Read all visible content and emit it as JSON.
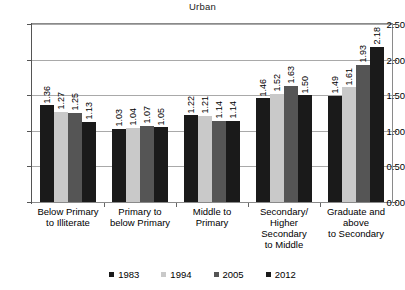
{
  "chart_data": {
    "type": "bar",
    "title": "Urban",
    "xlabel": "",
    "ylabel": "",
    "ylim": [
      0,
      2.5
    ],
    "ytick_labels": [
      "0.00",
      "0.50",
      "1.00",
      "1.50",
      "2.00",
      "2.50"
    ],
    "ytick_values": [
      0,
      0.5,
      1.0,
      1.5,
      2.0,
      2.5
    ],
    "grid": true,
    "legend_position": "bottom",
    "categories": [
      "Below Primary to Illiterate",
      "Primary to below Primary",
      "Middle to Primary",
      "Secondary/ Higher Secondary to Middle",
      "Graduate and above to Secondary"
    ],
    "category_lines": [
      [
        "Below Primary",
        "to Illiterate"
      ],
      [
        "Primary to",
        "below Primary"
      ],
      [
        "Middle to",
        "Primary"
      ],
      [
        "Secondary/",
        "Higher",
        "Secondary",
        "to Middle"
      ],
      [
        "Graduate and",
        "above",
        "to Secondary"
      ]
    ],
    "series": [
      {
        "name": "1983",
        "color": "#1a1a1a",
        "values": [
          1.36,
          1.03,
          1.22,
          1.46,
          1.49
        ],
        "labels": [
          "1.36",
          "1.03",
          "1.22",
          "1.46",
          "1.49"
        ]
      },
      {
        "name": "1994",
        "color": "#c9c9c9",
        "values": [
          1.27,
          1.04,
          1.21,
          1.52,
          1.61
        ],
        "labels": [
          "1.27",
          "1.04",
          "1.21",
          "1.52",
          "1.61"
        ]
      },
      {
        "name": "2005",
        "color": "#555555",
        "values": [
          1.25,
          1.07,
          1.14,
          1.63,
          1.93
        ],
        "labels": [
          "1.25",
          "1.07",
          "1.14",
          "1.63",
          "1.93"
        ]
      },
      {
        "name": "2012",
        "color": "#1a1a1a",
        "values": [
          1.13,
          1.05,
          1.14,
          1.5,
          2.18
        ],
        "labels": [
          "1.13",
          "1.05",
          "1.14",
          "1.50",
          "2.18"
        ]
      }
    ],
    "legend": [
      {
        "label": "1983",
        "color": "#1a1a1a"
      },
      {
        "label": "1994",
        "color": "#c9c9c9"
      },
      {
        "label": "2005",
        "color": "#555555"
      },
      {
        "label": "2012",
        "color": "#1a1a1a"
      }
    ]
  }
}
